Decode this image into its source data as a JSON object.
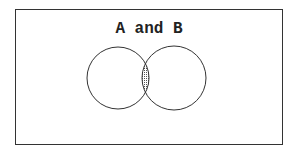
{
  "diagram": {
    "title": "A and B",
    "sets": [
      {
        "name": "A",
        "cx": 118,
        "cy": 78,
        "r": 31
      },
      {
        "name": "B",
        "cx": 174,
        "cy": 78,
        "r": 32
      }
    ],
    "highlighted_region": "intersection",
    "colors": {
      "stroke": "#333333",
      "shade": "#777777",
      "background": "#ffffff"
    }
  }
}
